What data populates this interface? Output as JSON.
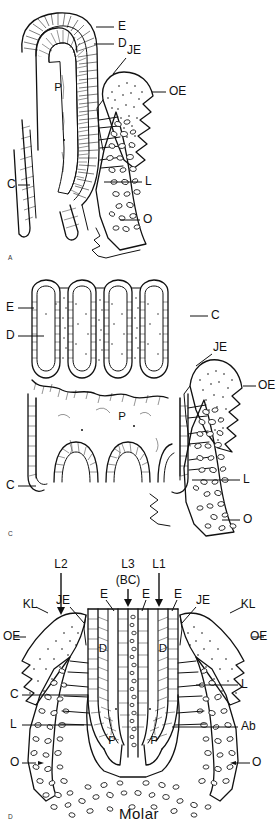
{
  "figure": {
    "caption": "Molar",
    "panels": [
      {
        "id": "A",
        "mark": "A",
        "name": "incisor-longitudinal-section",
        "labels": [
          {
            "key": "E",
            "text": "E"
          },
          {
            "key": "D",
            "text": "D"
          },
          {
            "key": "JE",
            "text": "JE"
          },
          {
            "key": "OE",
            "text": "OE"
          },
          {
            "key": "P",
            "text": "P"
          },
          {
            "key": "C",
            "text": "C"
          },
          {
            "key": "L",
            "text": "L"
          },
          {
            "key": "O",
            "text": "O"
          }
        ]
      },
      {
        "id": "C",
        "mark": "C",
        "name": "molar-crown-section",
        "labels": [
          {
            "key": "E",
            "text": "E"
          },
          {
            "key": "D",
            "text": "D"
          },
          {
            "key": "C1",
            "text": "C"
          },
          {
            "key": "JE",
            "text": "JE"
          },
          {
            "key": "OE",
            "text": "OE"
          },
          {
            "key": "P",
            "text": "P"
          },
          {
            "key": "C2",
            "text": "C"
          },
          {
            "key": "L",
            "text": "L"
          },
          {
            "key": "O",
            "text": "O"
          }
        ]
      },
      {
        "id": "D",
        "mark": "D",
        "name": "molar-two-root-section",
        "labels": [
          {
            "key": "L2",
            "text": "L2"
          },
          {
            "key": "L3",
            "text": "L3"
          },
          {
            "key": "BC",
            "text": "(BC)"
          },
          {
            "key": "L1",
            "text": "L1"
          },
          {
            "key": "E1",
            "text": "E"
          },
          {
            "key": "E2",
            "text": "E"
          },
          {
            "key": "E3",
            "text": "E"
          },
          {
            "key": "JEL",
            "text": "JE"
          },
          {
            "key": "JER",
            "text": "JE"
          },
          {
            "key": "KLL",
            "text": "KL"
          },
          {
            "key": "KLR",
            "text": "KL"
          },
          {
            "key": "OEL",
            "text": "OE"
          },
          {
            "key": "OER",
            "text": "OE"
          },
          {
            "key": "D1",
            "text": "D"
          },
          {
            "key": "D2",
            "text": "D"
          },
          {
            "key": "C",
            "text": "C"
          },
          {
            "key": "LL",
            "text": "L"
          },
          {
            "key": "LR",
            "text": "L"
          },
          {
            "key": "Ab",
            "text": "Ab"
          },
          {
            "key": "P1",
            "text": "P"
          },
          {
            "key": "P2",
            "text": "P"
          },
          {
            "key": "OL",
            "text": "O"
          },
          {
            "key": "OR",
            "text": "O"
          }
        ]
      }
    ]
  },
  "style": {
    "ink": "#111111",
    "paper": "#ffffff"
  }
}
